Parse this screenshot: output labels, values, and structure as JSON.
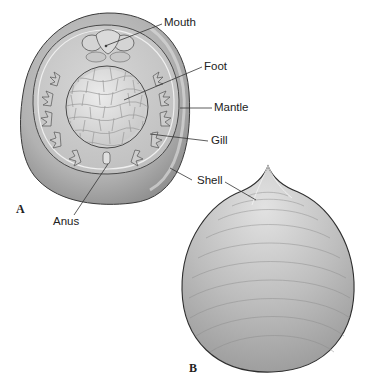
{
  "figure": {
    "panels": [
      {
        "id": "A",
        "letter": "A",
        "view": "ventral view of animal within shell",
        "labels": {
          "mouth": "Mouth",
          "foot": "Foot",
          "mantle": "Mantle",
          "gill": "Gill",
          "shell": "Shell",
          "anus": "Anus"
        }
      },
      {
        "id": "B",
        "letter": "B",
        "view": "dorsal view of conical shell",
        "labels": {
          "shell": "Shell"
        }
      }
    ],
    "colors": {
      "shell_outer": "#a9a9a9",
      "shell_rim_light": "#cfcfcf",
      "mantle": "#c4c4c4",
      "foot": "#dcdcdc",
      "foot_tile_line": "#9a9a9a",
      "outline": "#3a3a3a",
      "leader_line": "#333333",
      "shell_b_fill": "#b5b5b5"
    }
  }
}
